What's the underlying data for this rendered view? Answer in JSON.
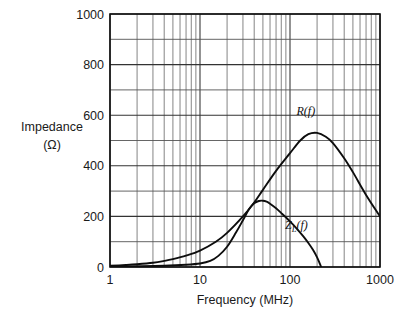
{
  "chart_data": {
    "type": "line",
    "title": "",
    "xlabel": "Frequency (MHz)",
    "ylabel": "Impedance",
    "ylabel_units": "(Ω)",
    "xscale": "log",
    "yscale": "linear",
    "xlim": [
      1,
      1000
    ],
    "ylim": [
      0,
      1000
    ],
    "xticks": [
      1,
      10,
      100,
      1000
    ],
    "xtick_labels": [
      "1",
      "10",
      "100",
      "1000"
    ],
    "yticks": [
      0,
      200,
      400,
      600,
      800,
      1000
    ],
    "ytick_labels": [
      "0",
      "200",
      "400",
      "600",
      "800",
      "1000"
    ],
    "y_minor_step": 100,
    "grid": true,
    "grid_x_minor_log": [
      2,
      3,
      4,
      5,
      6,
      7,
      8,
      9
    ],
    "legend": "inline-annotations",
    "series": [
      {
        "name": "R(f)",
        "label": "R(f)",
        "label_base": "R",
        "label_sub": "",
        "label_tail": "(f)",
        "label_x_mhz": 150,
        "label_y_ohm": 600,
        "color": "#0d0d0d",
        "points": [
          [
            1,
            5
          ],
          [
            1.5,
            8
          ],
          [
            2,
            11
          ],
          [
            3,
            17
          ],
          [
            4,
            24
          ],
          [
            5,
            31
          ],
          [
            7,
            45
          ],
          [
            10,
            65
          ],
          [
            15,
            100
          ],
          [
            20,
            135
          ],
          [
            30,
            200
          ],
          [
            40,
            255
          ],
          [
            50,
            305
          ],
          [
            70,
            380
          ],
          [
            100,
            450
          ],
          [
            130,
            500
          ],
          [
            160,
            525
          ],
          [
            200,
            530
          ],
          [
            250,
            515
          ],
          [
            300,
            490
          ],
          [
            400,
            430
          ],
          [
            500,
            375
          ],
          [
            700,
            285
          ],
          [
            1000,
            200
          ]
        ]
      },
      {
        "name": "ZL(f)",
        "label": "ZL(f)",
        "label_base": "Z",
        "label_sub": "L",
        "label_tail": "(f)",
        "label_x_mhz": 118,
        "label_y_ohm": 150,
        "color": "#0d0d0d",
        "points": [
          [
            1,
            2
          ],
          [
            2,
            3
          ],
          [
            4,
            5
          ],
          [
            7,
            9
          ],
          [
            10,
            14
          ],
          [
            13,
            24
          ],
          [
            16,
            44
          ],
          [
            20,
            80
          ],
          [
            25,
            135
          ],
          [
            30,
            185
          ],
          [
            35,
            228
          ],
          [
            40,
            252
          ],
          [
            45,
            261
          ],
          [
            50,
            262
          ],
          [
            55,
            258
          ],
          [
            60,
            250
          ],
          [
            70,
            232
          ],
          [
            80,
            213
          ],
          [
            90,
            196
          ],
          [
            100,
            180
          ],
          [
            120,
            150
          ],
          [
            140,
            122
          ],
          [
            160,
            95
          ],
          [
            180,
            68
          ],
          [
            200,
            38
          ],
          [
            215,
            12
          ],
          [
            222,
            0
          ]
        ]
      }
    ]
  },
  "axis": {
    "y_title_line1": "Impedance",
    "y_title_line2": "(Ω)",
    "x_title": "Frequency (MHz)"
  }
}
